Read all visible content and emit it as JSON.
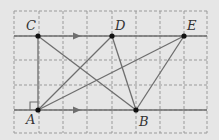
{
  "diagram": {
    "background": "#e6e6e6",
    "grid": {
      "x_lines": [
        14,
        39,
        63,
        87,
        112,
        136,
        160,
        184,
        207
      ],
      "y_lines": [
        11,
        36,
        60,
        85,
        110,
        133
      ],
      "color": "#9a9a9a",
      "style": "dashed"
    },
    "parallel_lines": [
      {
        "name": "line-CDE",
        "y": 36,
        "x1": 14,
        "x2": 207,
        "arrow_x": 78
      },
      {
        "name": "line-AB",
        "y": 110,
        "x1": 14,
        "x2": 207,
        "arrow_x": 78
      }
    ],
    "points": {
      "A": {
        "label": "A",
        "x": 38,
        "y": 110
      },
      "B": {
        "label": "B",
        "x": 136,
        "y": 110
      },
      "C": {
        "label": "C",
        "x": 38,
        "y": 36
      },
      "D": {
        "label": "D",
        "x": 112,
        "y": 36
      },
      "E": {
        "label": "E",
        "x": 184,
        "y": 36
      }
    },
    "segments": [
      [
        "A",
        "C"
      ],
      [
        "A",
        "D"
      ],
      [
        "A",
        "E"
      ],
      [
        "C",
        "B"
      ],
      [
        "D",
        "B"
      ],
      [
        "E",
        "B"
      ]
    ],
    "right_angle_at": "A",
    "line_color": "#6e6e6e",
    "point_color": "#111111"
  }
}
